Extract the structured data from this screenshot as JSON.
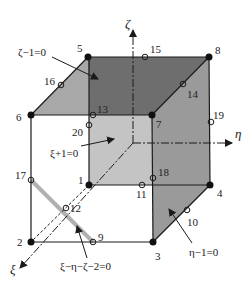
{
  "figure": {
    "axes": {
      "zeta": {
        "label": "ζ",
        "color": "#222222"
      },
      "eta": {
        "label": "η",
        "color": "#222222"
      },
      "xi": {
        "label": "ξ",
        "color": "#222222"
      }
    },
    "corner_nodes": [
      {
        "id": "1",
        "label": "1"
      },
      {
        "id": "2",
        "label": "2"
      },
      {
        "id": "3",
        "label": "3"
      },
      {
        "id": "4",
        "label": "4"
      },
      {
        "id": "5",
        "label": "5"
      },
      {
        "id": "6",
        "label": "6"
      },
      {
        "id": "7",
        "label": "7"
      },
      {
        "id": "8",
        "label": "8"
      }
    ],
    "midside_nodes": [
      {
        "id": "9",
        "label": "9"
      },
      {
        "id": "10",
        "label": "10"
      },
      {
        "id": "11",
        "label": "11"
      },
      {
        "id": "12",
        "label": "12"
      },
      {
        "id": "13",
        "label": "13"
      },
      {
        "id": "14",
        "label": "14"
      },
      {
        "id": "15",
        "label": "15"
      },
      {
        "id": "16",
        "label": "16"
      },
      {
        "id": "17",
        "label": "17"
      },
      {
        "id": "18",
        "label": "18"
      },
      {
        "id": "19",
        "label": "19"
      },
      {
        "id": "20",
        "label": "20"
      }
    ],
    "face_labels": {
      "top": "ζ−1=0",
      "back": "ξ+1=0",
      "right": "η−1=0",
      "cut": "ξ−η−ζ−2=0"
    },
    "colors": {
      "top_face": "#6e6e6e",
      "right_face": "#9a9a9a",
      "back_face": "#bdbdbd",
      "left_top_face": "#a8a8a8",
      "cut_line": "#b0b0b0",
      "edge": "#1a1a1a"
    }
  }
}
